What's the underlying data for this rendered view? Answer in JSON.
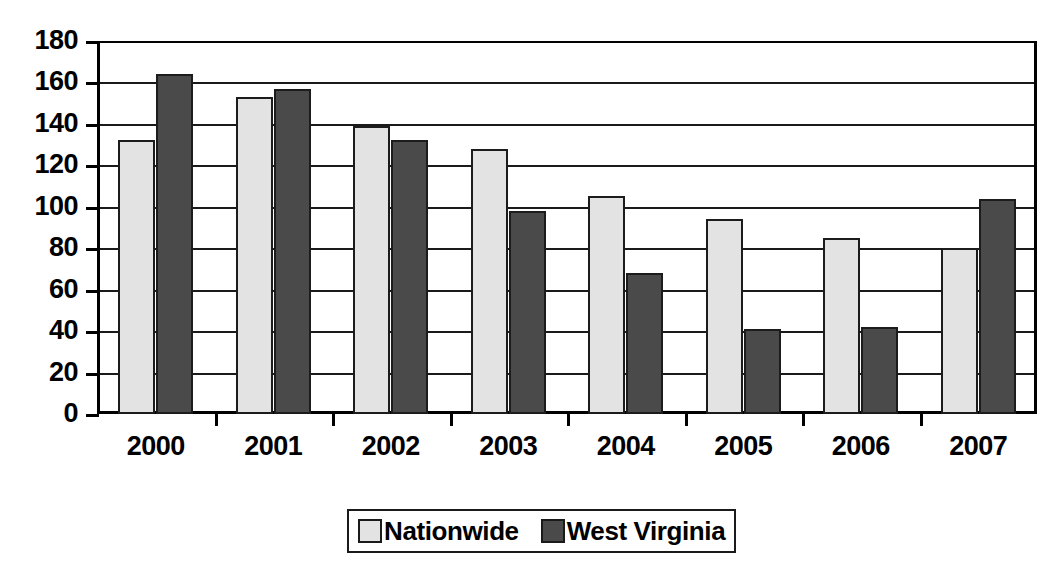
{
  "chart_data": {
    "type": "bar",
    "title": "",
    "subtitle": "",
    "xlabel": "",
    "ylabel": "",
    "categories": [
      "2000",
      "2001",
      "2002",
      "2003",
      "2004",
      "2005",
      "2006",
      "2007"
    ],
    "series": [
      {
        "name": "Nationwide",
        "color": "#e3e3e3",
        "values": [
          132,
          153,
          139,
          128,
          105,
          94,
          85,
          80
        ]
      },
      {
        "name": "West Virginia",
        "color": "#4a4a4a",
        "values": [
          164,
          157,
          132,
          98,
          68,
          41,
          42,
          104
        ]
      }
    ],
    "ylim": [
      0,
      180
    ],
    "ytick_step": 20,
    "yticks": [
      180,
      160,
      140,
      120,
      100,
      80,
      60,
      40,
      20,
      0
    ],
    "ytick_labels": [
      "180",
      "160",
      "140",
      "120",
      "100",
      "80",
      "60",
      "40",
      "20",
      "0"
    ],
    "grid": true,
    "grid_axis": "y",
    "legend_position": "bottom-center",
    "legend_entries": [
      "Nationwide",
      "West Virginia"
    ],
    "annotations": []
  },
  "axes": {
    "y_axis_name": "y-axis",
    "x_axis_name": "x-axis"
  },
  "colors": {
    "nationwide": "#e3e3e3",
    "west_virginia": "#4a4a4a",
    "axis": "#000000",
    "gridline": "#1a1a1a",
    "background": "#ffffff"
  }
}
